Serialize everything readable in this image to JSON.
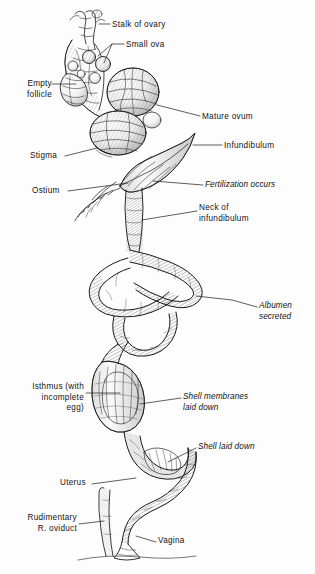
{
  "figure": {
    "background_color": "#fdfdfd",
    "ink_color": "#1a1a1a",
    "style": "pen-and-ink engraving, cross-hatched"
  },
  "labels": [
    {
      "id": "stalk-of-ovary",
      "text": "Stalk of ovary",
      "style": "roman",
      "align": "left",
      "x": 112,
      "y": 20
    },
    {
      "id": "small-ova",
      "text": "Small ova",
      "style": "roman",
      "align": "left",
      "x": 126,
      "y": 40
    },
    {
      "id": "empty-follicle",
      "text": "Empty\nfollicle",
      "style": "roman",
      "align": "right",
      "x": 14,
      "y": 79
    },
    {
      "id": "mature-ovum",
      "text": "Mature ovum",
      "style": "roman",
      "align": "left",
      "x": 202,
      "y": 112
    },
    {
      "id": "infundibulum",
      "text": "Infundibulum",
      "style": "roman",
      "align": "left",
      "x": 224,
      "y": 141
    },
    {
      "id": "stigma",
      "text": "Stigma",
      "style": "roman",
      "align": "left",
      "x": 30,
      "y": 154
    },
    {
      "id": "ostium",
      "text": "Ostium",
      "style": "roman",
      "align": "left",
      "x": 32,
      "y": 188
    },
    {
      "id": "fertilization-occurs",
      "text": "Fertilization occurs",
      "style": "italic",
      "align": "left",
      "x": 205,
      "y": 181
    },
    {
      "id": "neck-of-infundibulum",
      "text": "Neck of\ninfundibulum",
      "style": "roman",
      "align": "left",
      "x": 199,
      "y": 205
    },
    {
      "id": "albumen-secreted",
      "text": "Albumen\nsecreted",
      "style": "italic",
      "align": "left",
      "x": 259,
      "y": 303
    },
    {
      "id": "isthmus",
      "text": "Isthmus (with\nincomplete\negg)",
      "style": "roman",
      "align": "right",
      "x": 10,
      "y": 379
    },
    {
      "id": "shell-membranes",
      "text": "Shell membranes\nlaid down",
      "style": "italic",
      "align": "left",
      "x": 183,
      "y": 393
    },
    {
      "id": "shell-laid-down",
      "text": "Shell laid down",
      "style": "italic",
      "align": "left",
      "x": 198,
      "y": 444
    },
    {
      "id": "uterus",
      "text": "Uterus",
      "style": "roman",
      "align": "left",
      "x": 60,
      "y": 480
    },
    {
      "id": "rudimentary-oviduct",
      "text": "Rudimentary\nR. oviduct",
      "style": "roman",
      "align": "right",
      "x": 10,
      "y": 515
    },
    {
      "id": "vagina",
      "text": "Vagina",
      "style": "roman",
      "align": "left",
      "x": 158,
      "y": 538
    }
  ]
}
